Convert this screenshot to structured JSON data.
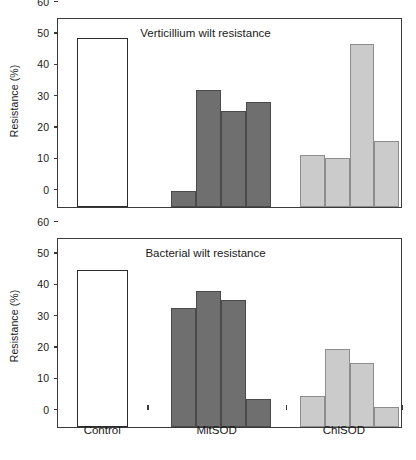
{
  "chart_data": [
    {
      "type": "bar",
      "panel_id": "verticillium",
      "title": "Verticillium wilt resistance",
      "xlabel": "",
      "ylabel": "Resistance (%)",
      "ylim": [
        0,
        60
      ],
      "yticks": [
        0,
        10,
        20,
        30,
        40,
        50,
        60
      ],
      "grid": false,
      "legend": "none",
      "categories": [
        "Control",
        "MitSOD",
        "ChlSOD"
      ],
      "groups": [
        {
          "name": "Control",
          "style": "control",
          "values": [
            54.0
          ]
        },
        {
          "name": "MitSOD",
          "style": "mit",
          "values": [
            5.0,
            37.5,
            30.5,
            33.5
          ]
        },
        {
          "name": "ChlSOD",
          "style": "chl",
          "values": [
            16.5,
            15.5,
            52.0,
            21.0
          ]
        }
      ]
    },
    {
      "type": "bar",
      "panel_id": "bacterial",
      "title": "Bacterial wilt resistance",
      "xlabel": "",
      "ylabel": "Resistance (%)",
      "ylim": [
        0,
        60
      ],
      "yticks": [
        0,
        10,
        20,
        30,
        40,
        50,
        60
      ],
      "grid": false,
      "legend": "none",
      "categories": [
        "Control",
        "MitSOD",
        "ChlSOD"
      ],
      "groups": [
        {
          "name": "Control",
          "style": "control",
          "values": [
            50.0
          ]
        },
        {
          "name": "MitSOD",
          "style": "mit",
          "values": [
            38.0,
            43.5,
            40.5,
            9.0
          ]
        },
        {
          "name": "ChlSOD",
          "style": "chl",
          "values": [
            10.0,
            25.0,
            20.5,
            6.5
          ]
        }
      ]
    }
  ],
  "axis": {
    "x_categories": [
      "Control",
      "MitSOD",
      "ChlSOD"
    ]
  },
  "colors": {
    "control_fill": "#ffffff",
    "mitsod_fill": "#6f6f6f",
    "chlsod_fill": "#cbcbcb",
    "axis": "#3a3a3a",
    "text": "#1a1a1a"
  }
}
